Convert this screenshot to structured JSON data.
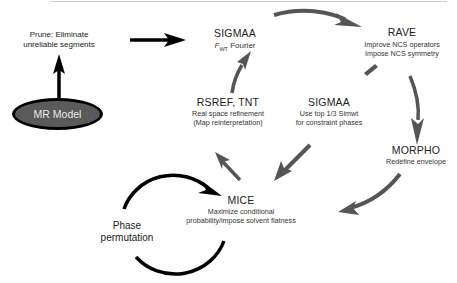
{
  "diagram": {
    "type": "flowchart-cycle",
    "nodes": {
      "mr_model": {
        "label": "MR Model"
      },
      "prune": {
        "line1": "Prune: Eliminate",
        "line2": "unreliable segments"
      },
      "sigmaa_top": {
        "title": "SIGMAA",
        "sub_italic": "F",
        "sub_subscript": "WT",
        "sub_rest": " Fourier"
      },
      "rave": {
        "title": "RAVE",
        "line1": "Improve NCS operators",
        "line2": "Impose NCS symmetry"
      },
      "rsref": {
        "title": "RSREF, TNT",
        "line1": "Real space refinement",
        "line2": "(Map reinterpretation)"
      },
      "sigmaa_mid": {
        "title": "SIGMAA",
        "line1": "Use top 1/3 Simwt",
        "line2": "for constraint phases"
      },
      "morpho": {
        "title": "MORPHO",
        "line1": "Redefine envelope"
      },
      "mice": {
        "title": "MICE",
        "line1": "Maximize conditional",
        "line2": "probability/impose solvent flatness"
      },
      "phase_perm": {
        "line1": "Phase",
        "line2": "permutation"
      }
    },
    "edges": [
      {
        "from": "MR Model",
        "to": "Prune"
      },
      {
        "from": "Prune",
        "to": "SIGMAA (top)"
      },
      {
        "from": "SIGMAA (top)",
        "to": "RAVE"
      },
      {
        "from": "RAVE",
        "to": "MORPHO"
      },
      {
        "from": "RAVE",
        "to": "SIGMAA (mid)"
      },
      {
        "from": "SIGMAA (mid)",
        "to": "MICE"
      },
      {
        "from": "MORPHO",
        "to": "MICE"
      },
      {
        "from": "MICE",
        "to": "RSREF, TNT"
      },
      {
        "from": "RSREF, TNT",
        "to": "SIGMAA (top)"
      },
      {
        "from": "MICE",
        "to": "MICE",
        "label": "Phase permutation"
      }
    ],
    "colors": {
      "arrow_black": "#000000",
      "arrow_gray": "#555555",
      "ellipse_fill": "#5a5a5a"
    }
  }
}
